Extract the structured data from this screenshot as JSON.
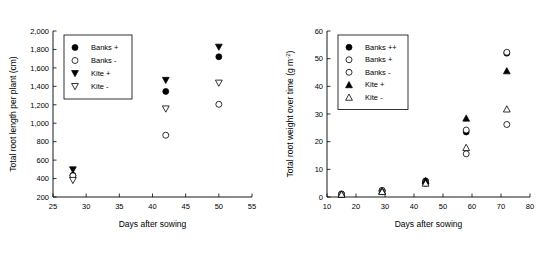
{
  "figure": {
    "panel_count": 2,
    "background": "#ffffff",
    "foreground": "#000000"
  },
  "chart_data": [
    {
      "type": "scatter",
      "panel": "left",
      "title": "",
      "xlabel": "Days after sowing",
      "ylabel": "Total root length per plant (cm)",
      "xlim": [
        25,
        55
      ],
      "ylim": [
        200,
        2000
      ],
      "xticks": [
        25,
        30,
        35,
        40,
        45,
        50,
        55
      ],
      "xtick_labels": [
        "25",
        "30",
        "35",
        "40",
        "45",
        "50",
        "55"
      ],
      "yticks": [
        200,
        400,
        600,
        800,
        1000,
        1200,
        1400,
        1600,
        1800,
        2000
      ],
      "ytick_labels": [
        "200",
        "400",
        "600",
        "800",
        "1,000",
        "1,200",
        "1,400",
        "1,600",
        "1,800",
        "2,000"
      ],
      "grid": false,
      "legend_position": "upper-left",
      "series": [
        {
          "name": "Banks +",
          "marker": "filled-circle",
          "x": [
            28,
            42,
            50
          ],
          "y": [
            435,
            1345,
            1720
          ]
        },
        {
          "name": "Banks -",
          "marker": "open-circle",
          "x": [
            28,
            42,
            50
          ],
          "y": [
            430,
            870,
            1205
          ]
        },
        {
          "name": "Kite +",
          "marker": "filled-triangle-down",
          "x": [
            28,
            42,
            50
          ],
          "y": [
            495,
            1465,
            1825
          ]
        },
        {
          "name": "Kite -",
          "marker": "open-triangle-down",
          "x": [
            28,
            42,
            50
          ],
          "y": [
            380,
            1155,
            1435
          ]
        }
      ]
    },
    {
      "type": "scatter",
      "panel": "right",
      "title": "",
      "xlabel": "Days after sowing",
      "ylabel": "Total root weight over time (g m-2)",
      "ylabel_base": "Total root weight over time (g m",
      "ylabel_sup": "-2",
      "ylabel_close": ")",
      "xlim": [
        10,
        80
      ],
      "ylim": [
        0,
        60
      ],
      "xticks": [
        10,
        20,
        30,
        40,
        50,
        60,
        70,
        80
      ],
      "xtick_labels": [
        "10",
        "20",
        "30",
        "40",
        "50",
        "60",
        "70",
        "80"
      ],
      "yticks": [
        0,
        10,
        20,
        30,
        40,
        50,
        60
      ],
      "ytick_labels": [
        "0",
        "10",
        "20",
        "30",
        "40",
        "50",
        "60"
      ],
      "grid": false,
      "legend_position": "upper-left",
      "series": [
        {
          "name": "Banks ++",
          "marker": "filled-circle",
          "x": [
            15,
            29,
            44,
            58,
            72
          ],
          "y": [
            1.0,
            2.3,
            5.8,
            23.5,
            52.0
          ]
        },
        {
          "name": "Banks +",
          "marker": "open-circle",
          "x": [
            15,
            29,
            44,
            58,
            72
          ],
          "y": [
            1.1,
            2.4,
            5.5,
            24.2,
            52.3
          ]
        },
        {
          "name": "Banks -",
          "marker": "open-circle",
          "x": [
            15,
            29,
            44,
            58,
            72
          ],
          "y": [
            0.9,
            1.9,
            4.9,
            15.6,
            26.2
          ]
        },
        {
          "name": "Kite +",
          "marker": "filled-triangle-up",
          "x": [
            15,
            29,
            44,
            58,
            72
          ],
          "y": [
            1.0,
            2.2,
            5.9,
            28.5,
            45.6
          ]
        },
        {
          "name": "Kite -",
          "marker": "open-triangle-up",
          "x": [
            15,
            29,
            44,
            58,
            72
          ],
          "y": [
            1.0,
            2.0,
            5.0,
            17.9,
            31.8
          ]
        }
      ]
    }
  ]
}
